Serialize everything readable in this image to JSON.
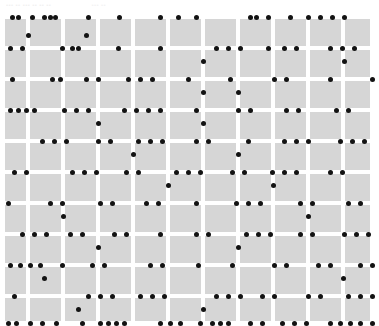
{
  "header": {
    "caption_left": "••• •• ••• •• •• ••",
    "caption_right": "••• ••"
  },
  "style": {
    "page_background": "#ffffff",
    "cell_fill": "#d6d6d6",
    "gridline_color": "#ffffff",
    "dot_color": "#131313",
    "header_text_color": "#f2f2f2"
  },
  "chart_data": {
    "type": "scatter",
    "title": "",
    "subtitle": "",
    "xlabel": "",
    "ylabel": "",
    "grid": true,
    "legend": null,
    "legend_position": "none",
    "axis": {
      "plot_left": 0,
      "plot_top": 12,
      "plot_width": 379,
      "plot_height": 311,
      "x_gridlines": [
        28,
        63,
        98,
        133,
        168,
        203,
        238,
        273,
        308,
        343,
        372
      ],
      "y_gridlines": [
        5,
        36,
        67,
        98,
        129,
        160,
        191,
        222,
        253,
        284,
        311
      ],
      "columns": 10,
      "rows": 10,
      "cell_width": 31,
      "cell_height": 27,
      "dot_radius": 2.5
    },
    "series": [
      {
        "name": "dots",
        "color": "#131313",
        "points": [
          [
            12,
            5
          ],
          [
            18,
            5
          ],
          [
            32,
            5
          ],
          [
            44,
            5
          ],
          [
            50,
            5
          ],
          [
            55,
            5
          ],
          [
            88,
            5
          ],
          [
            119,
            5
          ],
          [
            160,
            5
          ],
          [
            178,
            5
          ],
          [
            196,
            5
          ],
          [
            250,
            5
          ],
          [
            256,
            5
          ],
          [
            268,
            5
          ],
          [
            290,
            5
          ],
          [
            308,
            5
          ],
          [
            320,
            5
          ],
          [
            332,
            5
          ],
          [
            344,
            5
          ],
          [
            28,
            23
          ],
          [
            86,
            23
          ],
          [
            10,
            36
          ],
          [
            22,
            36
          ],
          [
            62,
            36
          ],
          [
            72,
            36
          ],
          [
            78,
            36
          ],
          [
            118,
            36
          ],
          [
            160,
            36
          ],
          [
            216,
            36
          ],
          [
            228,
            36
          ],
          [
            240,
            36
          ],
          [
            268,
            36
          ],
          [
            284,
            36
          ],
          [
            296,
            36
          ],
          [
            330,
            36
          ],
          [
            342,
            36
          ],
          [
            354,
            36
          ],
          [
            203,
            49
          ],
          [
            344,
            49
          ],
          [
            12,
            67
          ],
          [
            52,
            67
          ],
          [
            60,
            67
          ],
          [
            86,
            67
          ],
          [
            98,
            67
          ],
          [
            128,
            67
          ],
          [
            140,
            67
          ],
          [
            152,
            67
          ],
          [
            188,
            67
          ],
          [
            230,
            67
          ],
          [
            274,
            67
          ],
          [
            286,
            67
          ],
          [
            330,
            67
          ],
          [
            372,
            67
          ],
          [
            203,
            80
          ],
          [
            238,
            80
          ],
          [
            10,
            98
          ],
          [
            18,
            98
          ],
          [
            26,
            98
          ],
          [
            34,
            98
          ],
          [
            64,
            98
          ],
          [
            76,
            98
          ],
          [
            88,
            98
          ],
          [
            124,
            98
          ],
          [
            136,
            98
          ],
          [
            148,
            98
          ],
          [
            160,
            98
          ],
          [
            196,
            98
          ],
          [
            238,
            98
          ],
          [
            250,
            98
          ],
          [
            286,
            98
          ],
          [
            298,
            98
          ],
          [
            336,
            98
          ],
          [
            348,
            98
          ],
          [
            98,
            111
          ],
          [
            203,
            111
          ],
          [
            42,
            129
          ],
          [
            54,
            129
          ],
          [
            66,
            129
          ],
          [
            98,
            129
          ],
          [
            110,
            129
          ],
          [
            138,
            129
          ],
          [
            150,
            129
          ],
          [
            162,
            129
          ],
          [
            196,
            129
          ],
          [
            208,
            129
          ],
          [
            248,
            129
          ],
          [
            284,
            129
          ],
          [
            296,
            129
          ],
          [
            308,
            129
          ],
          [
            340,
            129
          ],
          [
            352,
            129
          ],
          [
            364,
            129
          ],
          [
            133,
            142
          ],
          [
            238,
            142
          ],
          [
            14,
            160
          ],
          [
            26,
            160
          ],
          [
            72,
            160
          ],
          [
            84,
            160
          ],
          [
            96,
            160
          ],
          [
            126,
            160
          ],
          [
            138,
            160
          ],
          [
            176,
            160
          ],
          [
            188,
            160
          ],
          [
            200,
            160
          ],
          [
            232,
            160
          ],
          [
            244,
            160
          ],
          [
            272,
            160
          ],
          [
            284,
            160
          ],
          [
            296,
            160
          ],
          [
            330,
            160
          ],
          [
            342,
            160
          ],
          [
            168,
            173
          ],
          [
            273,
            173
          ],
          [
            8,
            191
          ],
          [
            50,
            191
          ],
          [
            62,
            191
          ],
          [
            100,
            191
          ],
          [
            112,
            191
          ],
          [
            146,
            191
          ],
          [
            158,
            191
          ],
          [
            196,
            191
          ],
          [
            236,
            191
          ],
          [
            248,
            191
          ],
          [
            260,
            191
          ],
          [
            300,
            191
          ],
          [
            312,
            191
          ],
          [
            348,
            191
          ],
          [
            360,
            191
          ],
          [
            63,
            204
          ],
          [
            308,
            204
          ],
          [
            22,
            222
          ],
          [
            34,
            222
          ],
          [
            46,
            222
          ],
          [
            70,
            222
          ],
          [
            82,
            222
          ],
          [
            114,
            222
          ],
          [
            126,
            222
          ],
          [
            160,
            222
          ],
          [
            196,
            222
          ],
          [
            208,
            222
          ],
          [
            246,
            222
          ],
          [
            258,
            222
          ],
          [
            270,
            222
          ],
          [
            300,
            222
          ],
          [
            312,
            222
          ],
          [
            344,
            222
          ],
          [
            356,
            222
          ],
          [
            368,
            222
          ],
          [
            98,
            235
          ],
          [
            238,
            235
          ],
          [
            10,
            253
          ],
          [
            20,
            253
          ],
          [
            30,
            253
          ],
          [
            40,
            253
          ],
          [
            62,
            253
          ],
          [
            92,
            253
          ],
          [
            104,
            253
          ],
          [
            150,
            253
          ],
          [
            162,
            253
          ],
          [
            198,
            253
          ],
          [
            232,
            253
          ],
          [
            274,
            253
          ],
          [
            286,
            253
          ],
          [
            318,
            253
          ],
          [
            330,
            253
          ],
          [
            360,
            253
          ],
          [
            372,
            253
          ],
          [
            44,
            266
          ],
          [
            343,
            266
          ],
          [
            14,
            284
          ],
          [
            88,
            284
          ],
          [
            100,
            284
          ],
          [
            112,
            284
          ],
          [
            140,
            284
          ],
          [
            152,
            284
          ],
          [
            164,
            284
          ],
          [
            216,
            284
          ],
          [
            228,
            284
          ],
          [
            240,
            284
          ],
          [
            262,
            284
          ],
          [
            274,
            284
          ],
          [
            308,
            284
          ],
          [
            320,
            284
          ],
          [
            348,
            284
          ],
          [
            360,
            284
          ],
          [
            372,
            284
          ],
          [
            78,
            297
          ],
          [
            203,
            297
          ],
          [
            8,
            311
          ],
          [
            16,
            311
          ],
          [
            30,
            311
          ],
          [
            42,
            311
          ],
          [
            56,
            311
          ],
          [
            82,
            311
          ],
          [
            100,
            311
          ],
          [
            108,
            311
          ],
          [
            116,
            311
          ],
          [
            124,
            311
          ],
          [
            160,
            311
          ],
          [
            170,
            311
          ],
          [
            180,
            311
          ],
          [
            200,
            311
          ],
          [
            212,
            311
          ],
          [
            220,
            311
          ],
          [
            228,
            311
          ],
          [
            250,
            311
          ],
          [
            262,
            311
          ],
          [
            282,
            311
          ],
          [
            294,
            311
          ],
          [
            306,
            311
          ],
          [
            330,
            311
          ],
          [
            340,
            311
          ],
          [
            350,
            311
          ],
          [
            360,
            311
          ],
          [
            372,
            311
          ]
        ]
      }
    ]
  }
}
